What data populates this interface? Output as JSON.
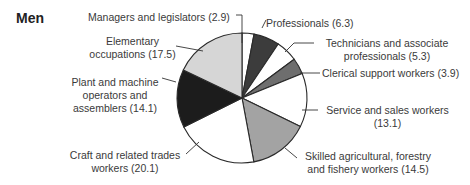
{
  "chart_data": {
    "type": "pie",
    "title": "Men",
    "start_angle_deg": 0,
    "direction": "clockwise",
    "slices": [
      {
        "label": "Managers and legislators",
        "value": 2.9,
        "color": "#ffffff"
      },
      {
        "label": "Professionals",
        "value": 6.3,
        "color": "#3c3c3c"
      },
      {
        "label": "Technicians and associate professionals",
        "value": 5.3,
        "color": "#ffffff"
      },
      {
        "label": "Clerical support workers",
        "value": 3.9,
        "color": "#6e6e6e"
      },
      {
        "label": "Service and sales workers",
        "value": 13.1,
        "color": "#ffffff"
      },
      {
        "label": "Skilled agricultural, forestry and fishery workers",
        "value": 14.5,
        "color": "#a3a3a3"
      },
      {
        "label": "Craft and related trades workers",
        "value": 20.1,
        "color": "#ffffff"
      },
      {
        "label": "Plant and machine operators and assemblers",
        "value": 14.1,
        "color": "#1c1c1c"
      },
      {
        "label": "Elementary occupations",
        "value": 17.5,
        "color": "#d6d6d6"
      }
    ],
    "labels_text": {
      "managers": "Managers and legislators (2.9)",
      "professionals": "Professionals (6.3)",
      "technicians_1": "Technicians and associate",
      "technicians_2": "professionals (5.3)",
      "clerical": "Clerical support workers (3.9)",
      "service_1": "Service and sales workers",
      "service_2": "(13.1)",
      "skilled_1": "Skilled agricultural, forestry",
      "skilled_2": "and fishery workers (14.5)",
      "craft_1": "Craft and related trades",
      "craft_2": "workers (20.1)",
      "plant_1": "Plant and machine",
      "plant_2": "operators and",
      "plant_3": "assemblers (14.1)",
      "elementary_1": "Elementary",
      "elementary_2": "occupations (17.5)"
    },
    "legend": "none (direct labels with leader lines)"
  }
}
